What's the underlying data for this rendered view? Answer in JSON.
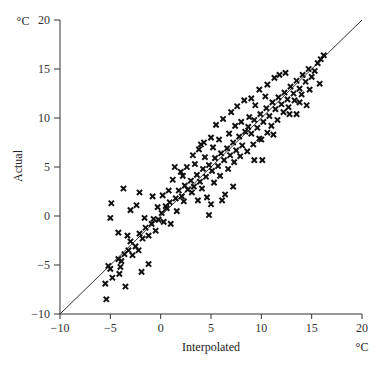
{
  "chart_data": {
    "type": "scatter",
    "title": "",
    "xlabel": "Interpolated",
    "ylabel": "Actual",
    "x_unit": "°C",
    "y_unit": "°C",
    "xlim": [
      -10,
      20
    ],
    "ylim": [
      -10,
      20
    ],
    "x_ticks": [
      -10,
      -5,
      0,
      5,
      10,
      15,
      20
    ],
    "y_ticks": [
      -10,
      -5,
      0,
      5,
      10,
      15,
      20
    ],
    "grid": false,
    "legend": null,
    "marker": "x",
    "reference_line": {
      "label": "y = x",
      "from": [
        -10,
        -10
      ],
      "to": [
        20,
        20
      ]
    },
    "series": [
      {
        "name": "Stations",
        "points": [
          [
            -5.4,
            -8.5
          ],
          [
            -5.5,
            -6.9
          ],
          [
            -4.8,
            -6.3
          ],
          [
            -3.5,
            -7.2
          ],
          [
            -1.9,
            -5.7
          ],
          [
            -1.2,
            -4.9
          ],
          [
            -5.2,
            -5.1
          ],
          [
            -5.0,
            -5.4
          ],
          [
            -4.2,
            -4.4
          ],
          [
            -4.0,
            -5.2
          ],
          [
            -4.1,
            -5.9
          ],
          [
            -3.9,
            -4.6
          ],
          [
            -3.6,
            -3.9
          ],
          [
            -3.2,
            -3.5
          ],
          [
            -2.8,
            -4.0
          ],
          [
            -2.5,
            -3.1
          ],
          [
            -2.2,
            -3.5
          ],
          [
            -3.0,
            -2.6
          ],
          [
            -3.3,
            -2.0
          ],
          [
            -2.1,
            -1.8
          ],
          [
            -1.8,
            -2.3
          ],
          [
            -1.5,
            -1.2
          ],
          [
            -1.2,
            -2.0
          ],
          [
            -0.9,
            -0.8
          ],
          [
            -0.5,
            -1.5
          ],
          [
            -0.2,
            -0.4
          ],
          [
            0.1,
            0.3
          ],
          [
            0.3,
            -0.6
          ],
          [
            0.6,
            0.8
          ],
          [
            0.9,
            1.4
          ],
          [
            -5.0,
            -0.2
          ],
          [
            -4.9,
            1.3
          ],
          [
            -3.7,
            2.8
          ],
          [
            -2.1,
            2.4
          ],
          [
            -4.2,
            -1.7
          ],
          [
            -1.6,
            -0.2
          ],
          [
            -3.0,
            0.6
          ],
          [
            -2.4,
            1.1
          ],
          [
            -0.8,
            2.0
          ],
          [
            1.2,
            3.7
          ],
          [
            1.0,
            -0.8
          ],
          [
            0.2,
            2.1
          ],
          [
            1.5,
            1.8
          ],
          [
            1.8,
            2.6
          ],
          [
            2.1,
            2.0
          ],
          [
            2.4,
            3.1
          ],
          [
            2.7,
            2.7
          ],
          [
            3.0,
            3.6
          ],
          [
            3.3,
            3.0
          ],
          [
            3.6,
            4.2
          ],
          [
            3.9,
            3.5
          ],
          [
            4.2,
            4.8
          ],
          [
            4.5,
            4.0
          ],
          [
            4.8,
            5.2
          ],
          [
            5.1,
            4.6
          ],
          [
            5.4,
            5.9
          ],
          [
            5.7,
            5.1
          ],
          [
            6.0,
            6.4
          ],
          [
            6.3,
            5.7
          ],
          [
            6.6,
            6.9
          ],
          [
            6.9,
            6.2
          ],
          [
            7.2,
            7.5
          ],
          [
            7.5,
            6.7
          ],
          [
            7.8,
            8.1
          ],
          [
            8.1,
            7.2
          ],
          [
            8.4,
            8.6
          ],
          [
            2.0,
            4.5
          ],
          [
            2.6,
            5.0
          ],
          [
            3.2,
            6.2
          ],
          [
            3.8,
            6.8
          ],
          [
            4.3,
            7.5
          ],
          [
            5.0,
            8.0
          ],
          [
            5.5,
            9.3
          ],
          [
            4.0,
            7.3
          ],
          [
            6.2,
            9.9
          ],
          [
            7.0,
            10.6
          ],
          [
            7.6,
            11.2
          ],
          [
            8.3,
            11.8
          ],
          [
            4.8,
            0.1
          ],
          [
            5.0,
            1.2
          ],
          [
            6.1,
            1.6
          ],
          [
            6.4,
            2.2
          ],
          [
            7.2,
            3.0
          ],
          [
            4.6,
            1.9
          ],
          [
            8.7,
            9.1
          ],
          [
            9.0,
            8.4
          ],
          [
            9.3,
            9.8
          ],
          [
            9.6,
            9.0
          ],
          [
            9.9,
            10.4
          ],
          [
            10.2,
            9.6
          ],
          [
            10.5,
            11.0
          ],
          [
            10.8,
            10.2
          ],
          [
            11.1,
            11.6
          ],
          [
            11.4,
            10.9
          ],
          [
            11.7,
            12.1
          ],
          [
            12.0,
            11.4
          ],
          [
            12.3,
            12.6
          ],
          [
            12.6,
            11.9
          ],
          [
            12.9,
            13.2
          ],
          [
            13.2,
            12.5
          ],
          [
            13.5,
            13.8
          ],
          [
            13.8,
            13.0
          ],
          [
            9.3,
            5.7
          ],
          [
            10.1,
            5.7
          ],
          [
            10.0,
            7.8
          ],
          [
            11.2,
            8.3
          ],
          [
            12.8,
            10.4
          ],
          [
            13.5,
            10.4
          ],
          [
            9.0,
            12.0
          ],
          [
            9.8,
            12.9
          ],
          [
            10.6,
            13.4
          ],
          [
            11.3,
            14.1
          ],
          [
            11.8,
            14.4
          ],
          [
            12.4,
            14.6
          ],
          [
            14.1,
            14.4
          ],
          [
            14.4,
            13.7
          ],
          [
            14.7,
            15.0
          ],
          [
            15.0,
            14.2
          ],
          [
            15.3,
            14.8
          ],
          [
            15.6,
            15.6
          ],
          [
            15.9,
            16.0
          ],
          [
            16.2,
            16.4
          ],
          [
            15.8,
            13.5
          ],
          [
            14.8,
            12.9
          ],
          [
            14.5,
            11.3
          ],
          [
            13.8,
            11.6
          ],
          [
            1.4,
            5.0
          ],
          [
            2.2,
            4.1
          ],
          [
            3.4,
            5.3
          ],
          [
            4.4,
            6.0
          ],
          [
            5.2,
            7.0
          ],
          [
            5.8,
            7.8
          ],
          [
            6.8,
            8.4
          ],
          [
            7.4,
            9.2
          ],
          [
            8.0,
            9.6
          ],
          [
            8.8,
            10.1
          ],
          [
            9.4,
            11.3
          ],
          [
            10.4,
            12.2
          ],
          [
            0.5,
            1.0
          ],
          [
            0.8,
            2.6
          ],
          [
            -0.3,
            0.9
          ],
          [
            -0.7,
            -0.3
          ],
          [
            1.6,
            0.5
          ],
          [
            2.3,
            1.5
          ],
          [
            3.1,
            2.4
          ],
          [
            3.7,
            1.6
          ],
          [
            4.1,
            2.8
          ],
          [
            5.3,
            3.4
          ],
          [
            5.9,
            4.1
          ],
          [
            6.7,
            4.8
          ],
          [
            7.3,
            5.5
          ],
          [
            7.9,
            6.1
          ],
          [
            8.6,
            6.6
          ],
          [
            9.2,
            7.3
          ],
          [
            9.8,
            7.9
          ],
          [
            10.6,
            8.5
          ],
          [
            11.0,
            9.2
          ],
          [
            11.6,
            9.8
          ],
          [
            12.2,
            10.6
          ],
          [
            12.7,
            11.1
          ],
          [
            13.3,
            11.8
          ],
          [
            14.0,
            12.4
          ]
        ]
      }
    ]
  }
}
